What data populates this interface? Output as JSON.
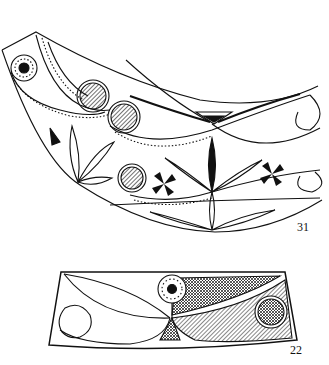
{
  "figures": [
    {
      "number": "31",
      "subject": "curved horn with ornamental engraving: spirals, dotted bands, hatched circles, leaf motifs, pinwheel crosses"
    },
    {
      "number": "22",
      "subject": "trapezoidal panel with spiral, dotted rosette, cross-hatched and hatched leaf fields"
    }
  ],
  "colors": {
    "ink": "#111111",
    "paper": "#ffffff"
  }
}
